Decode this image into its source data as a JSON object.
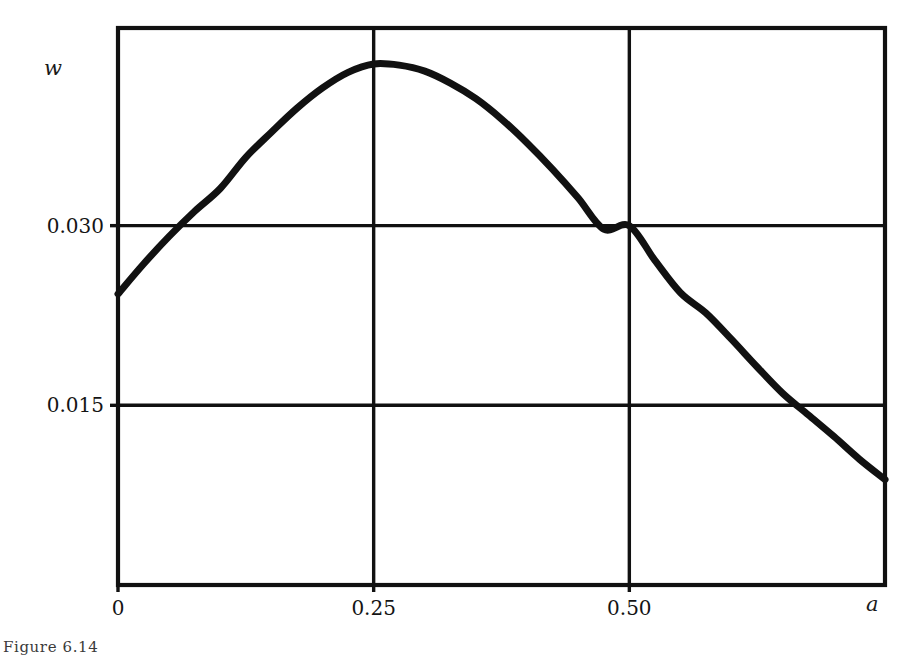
{
  "figure": {
    "caption": "Figure 6.14",
    "background_color": "#ffffff",
    "ink_color": "#111111"
  },
  "axes": {
    "y_axis_name": "w",
    "x_axis_name": "a"
  },
  "chart_data": {
    "type": "line",
    "title": "",
    "subtitle": "",
    "xlabel": "a",
    "ylabel": "w",
    "xlim": [
      0,
      0.75
    ],
    "ylim": [
      0,
      0.0465
    ],
    "grid": true,
    "legend": null,
    "legend_position": "none",
    "x_ticks": [
      0,
      0.25,
      0.5
    ],
    "x_tick_labels": [
      "0",
      "0.25",
      "0.50"
    ],
    "y_ticks": [
      0.015,
      0.03
    ],
    "y_tick_labels": [
      "0.015",
      "0.030"
    ],
    "series": [
      {
        "name": "w(a)",
        "color": "#111111",
        "line_width": 7,
        "x": [
          0.0,
          0.025,
          0.05,
          0.075,
          0.1,
          0.125,
          0.15,
          0.175,
          0.2,
          0.225,
          0.25,
          0.275,
          0.3,
          0.325,
          0.35,
          0.375,
          0.4,
          0.425,
          0.45,
          0.475,
          0.5,
          0.525,
          0.55,
          0.575,
          0.6,
          0.625,
          0.65,
          0.675,
          0.7,
          0.725,
          0.75
        ],
        "y": [
          0.0243,
          0.0268,
          0.0291,
          0.0312,
          0.0331,
          0.0357,
          0.0378,
          0.0398,
          0.0415,
          0.0428,
          0.0435,
          0.0434,
          0.0429,
          0.0419,
          0.0406,
          0.0389,
          0.0369,
          0.0347,
          0.0323,
          0.0297,
          0.03,
          0.0271,
          0.0244,
          0.0227,
          0.0205,
          0.0182,
          0.016,
          0.0142,
          0.0124,
          0.0105,
          0.0088
        ]
      }
    ],
    "annotations": [
      {
        "label": "maximum",
        "x": 0.23,
        "y": 0.0436
      },
      {
        "label": "crosses 0.030 (rising)",
        "x": 0.039,
        "y": 0.03
      },
      {
        "label": "crosses 0.030 (falling)",
        "x": 0.5,
        "y": 0.03
      },
      {
        "label": "crosses 0.015 (falling)",
        "x": 0.662,
        "y": 0.015
      }
    ]
  }
}
